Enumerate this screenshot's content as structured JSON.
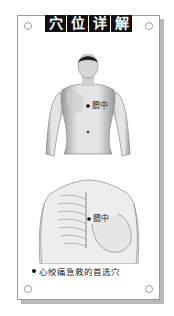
{
  "header": {
    "title_chars": [
      "穴",
      "位",
      "详",
      "解"
    ]
  },
  "figure_front": {
    "point_label": "膻中",
    "description": "front view of male torso with acupoint marked on chest"
  },
  "figure_chest": {
    "point_label": "膻中",
    "description": "female chest with rib cage overlay and acupoint marked at sternum"
  },
  "caption": {
    "text": "心绞痛急救的首选穴"
  },
  "colors": {
    "header_bg": "#111111",
    "header_text": "#ffffff",
    "card_border": "#9a9a9a",
    "shadow": "#b9b9b9"
  }
}
